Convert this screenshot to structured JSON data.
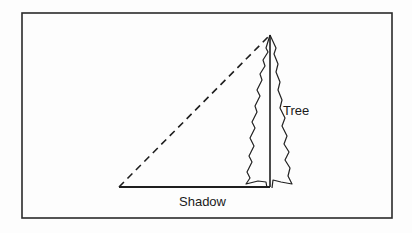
{
  "diagram": {
    "type": "geometry-illustration",
    "labels": {
      "tree": "Tree",
      "shadow": "Shadow"
    },
    "elements": {
      "frame": {
        "x": 22,
        "y": 13,
        "width": 370,
        "height": 205
      },
      "hypotenuse": {
        "style": "dashed",
        "from": [
          119,
          187
        ],
        "to": [
          270,
          35
        ]
      },
      "tree_height_line": {
        "style": "solid",
        "from": [
          270,
          35
        ],
        "to": [
          270,
          187
        ]
      },
      "shadow_line": {
        "style": "solid",
        "from": [
          119,
          187
        ],
        "to": [
          270,
          187
        ]
      }
    },
    "colors": {
      "line": "#222222",
      "background": "#fdfdfd"
    }
  }
}
